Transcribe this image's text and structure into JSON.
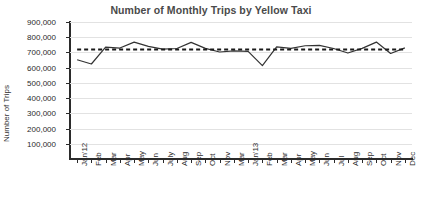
{
  "chart_data": {
    "type": "line",
    "title": "Number of Monthly Trips by Yellow Taxi",
    "xlabel": "",
    "ylabel": "Number of Trips",
    "ylim": [
      0,
      900000
    ],
    "ytick_step": 100000,
    "ytick_labels": [
      "900,000",
      "800,000",
      "700,000",
      "600,000",
      "500,000",
      "400,000",
      "300,000",
      "200,000",
      "100,000"
    ],
    "ytick_values": [
      900000,
      800000,
      700000,
      600000,
      500000,
      400000,
      300000,
      200000,
      100000
    ],
    "grid": true,
    "legend": "none",
    "categories": [
      "Jan'12",
      "Feb",
      "Mar",
      "Apr",
      "May",
      "Jun",
      "July",
      "Aug",
      "Sep",
      "Oct",
      "Nov",
      "Mar",
      "Jan'13",
      "Feb",
      "Mar",
      "Apr",
      "May",
      "Jun",
      "Jul",
      "Aug",
      "Sep",
      "Oct",
      "Nov",
      "Dec"
    ],
    "series": [
      {
        "name": "Number of Trips",
        "style": "solid",
        "color": "#333333",
        "values": [
          652000,
          624000,
          735000,
          729000,
          768000,
          740000,
          722000,
          726000,
          766000,
          727000,
          703000,
          710000,
          707000,
          613000,
          737000,
          727000,
          744000,
          747000,
          726000,
          696000,
          727000,
          768000,
          693000,
          730000
        ]
      },
      {
        "name": "Trend",
        "style": "dashed",
        "color": "#1a1a1a",
        "values": [
          719000,
          719000,
          719000,
          719000,
          719000,
          719000,
          719000,
          719000,
          719000,
          719000,
          719000,
          719000,
          719000,
          719000,
          719000,
          719000,
          719000,
          719000,
          719000,
          719000,
          719000,
          719000,
          719000,
          719000
        ]
      }
    ]
  }
}
